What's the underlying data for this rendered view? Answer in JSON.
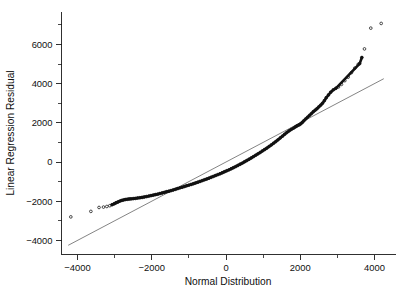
{
  "chart_data": {
    "type": "scatter",
    "title": "",
    "subtitle": "",
    "xlabel": "Normal Distribution",
    "ylabel": "Linear Regression Residual",
    "xlim": [
      -4600,
      4600
    ],
    "ylim": [
      -4600,
      7400
    ],
    "grid": false,
    "legend": null,
    "legend_position": "none",
    "x_ticks": [
      -4000,
      -2000,
      0,
      2000,
      4000
    ],
    "x_tick_labels": [
      "−4000",
      "−2000",
      "0",
      "2000",
      "4000"
    ],
    "x_minor_ticks": [
      -3000,
      -1000,
      1000,
      3000
    ],
    "y_ticks": [
      -4000,
      -2000,
      0,
      2000,
      4000,
      6000
    ],
    "y_tick_labels": [
      "−4000",
      "−2000",
      "0",
      "2000",
      "4000",
      "6000"
    ],
    "y_minor_ticks": [
      -3000,
      -1000,
      1000,
      3000,
      5000,
      7000
    ],
    "annotations": [],
    "series": [
      {
        "name": "Q-Q reference line",
        "type": "line",
        "color": "#6e6e6e",
        "x": [
          -4250,
          4250
        ],
        "y": [
          -4250,
          4250
        ]
      },
      {
        "name": "Residual quantiles",
        "type": "scatter",
        "marker": "open-circle",
        "color": "#111111",
        "points": [
          [
            -4180,
            -2800
          ],
          [
            -3640,
            -2520
          ],
          [
            -3420,
            -2320
          ],
          [
            -3300,
            -2300
          ],
          [
            -3210,
            -2270
          ],
          [
            -3130,
            -2230
          ],
          [
            -3070,
            -2180
          ],
          [
            -3010,
            -2130
          ],
          [
            -2960,
            -2080
          ],
          [
            -2910,
            -2040
          ],
          [
            -2860,
            -1995
          ],
          [
            -2810,
            -1960
          ],
          [
            -2760,
            -1935
          ],
          [
            -2710,
            -1915
          ],
          [
            -2660,
            -1900
          ],
          [
            -2610,
            -1890
          ],
          [
            -2560,
            -1880
          ],
          [
            -2500,
            -1870
          ],
          [
            -2440,
            -1855
          ],
          [
            -2380,
            -1840
          ],
          [
            -2320,
            -1825
          ],
          [
            -2260,
            -1805
          ],
          [
            -2200,
            -1785
          ],
          [
            -2140,
            -1765
          ],
          [
            -2080,
            -1740
          ],
          [
            -2020,
            -1715
          ],
          [
            -1960,
            -1690
          ],
          [
            -1900,
            -1665
          ],
          [
            -1840,
            -1640
          ],
          [
            -1780,
            -1610
          ],
          [
            -1720,
            -1580
          ],
          [
            -1660,
            -1550
          ],
          [
            -1600,
            -1520
          ],
          [
            -1540,
            -1490
          ],
          [
            -1480,
            -1460
          ],
          [
            -1420,
            -1425
          ],
          [
            -1360,
            -1390
          ],
          [
            -1300,
            -1355
          ],
          [
            -1240,
            -1320
          ],
          [
            -1180,
            -1285
          ],
          [
            -1120,
            -1250
          ],
          [
            -1060,
            -1215
          ],
          [
            -1000,
            -1180
          ],
          [
            -940,
            -1145
          ],
          [
            -880,
            -1110
          ],
          [
            -820,
            -1070
          ],
          [
            -760,
            -1030
          ],
          [
            -700,
            -990
          ],
          [
            -640,
            -950
          ],
          [
            -580,
            -910
          ],
          [
            -520,
            -870
          ],
          [
            -460,
            -825
          ],
          [
            -400,
            -780
          ],
          [
            -340,
            -735
          ],
          [
            -280,
            -690
          ],
          [
            -220,
            -645
          ],
          [
            -160,
            -600
          ],
          [
            -100,
            -550
          ],
          [
            -40,
            -500
          ],
          [
            20,
            -450
          ],
          [
            80,
            -400
          ],
          [
            140,
            -345
          ],
          [
            200,
            -290
          ],
          [
            260,
            -235
          ],
          [
            320,
            -175
          ],
          [
            380,
            -115
          ],
          [
            440,
            -55
          ],
          [
            500,
            10
          ],
          [
            560,
            75
          ],
          [
            620,
            140
          ],
          [
            680,
            205
          ],
          [
            740,
            275
          ],
          [
            800,
            345
          ],
          [
            860,
            415
          ],
          [
            920,
            485
          ],
          [
            980,
            560
          ],
          [
            1040,
            635
          ],
          [
            1100,
            710
          ],
          [
            1160,
            790
          ],
          [
            1220,
            870
          ],
          [
            1280,
            955
          ],
          [
            1340,
            1040
          ],
          [
            1400,
            1130
          ],
          [
            1460,
            1225
          ],
          [
            1520,
            1320
          ],
          [
            1580,
            1415
          ],
          [
            1640,
            1505
          ],
          [
            1700,
            1590
          ],
          [
            1760,
            1665
          ],
          [
            1820,
            1730
          ],
          [
            1870,
            1790
          ],
          [
            1910,
            1840
          ],
          [
            1950,
            1880
          ],
          [
            1985,
            1910
          ],
          [
            2020,
            1960
          ],
          [
            2060,
            2030
          ],
          [
            2100,
            2110
          ],
          [
            2150,
            2200
          ],
          [
            2200,
            2290
          ],
          [
            2250,
            2380
          ],
          [
            2300,
            2470
          ],
          [
            2350,
            2560
          ],
          [
            2400,
            2640
          ],
          [
            2450,
            2720
          ],
          [
            2500,
            2810
          ],
          [
            2550,
            2900
          ],
          [
            2600,
            3000
          ],
          [
            2650,
            3130
          ],
          [
            2700,
            3280
          ],
          [
            2760,
            3420
          ],
          [
            2820,
            3560
          ],
          [
            2890,
            3680
          ],
          [
            2960,
            3760
          ],
          [
            3030,
            3830
          ],
          [
            3110,
            3960
          ],
          [
            3200,
            4150
          ],
          [
            3290,
            4330
          ],
          [
            3380,
            4560
          ],
          [
            3470,
            4790
          ],
          [
            3560,
            4980
          ],
          [
            3600,
            5020
          ],
          [
            3660,
            5330
          ],
          [
            3730,
            5770
          ],
          [
            3900,
            6830
          ],
          [
            4180,
            7070
          ]
        ]
      }
    ]
  },
  "axes": {
    "x_title": "Normal Distribution",
    "y_title": "Linear Regression Residual"
  }
}
